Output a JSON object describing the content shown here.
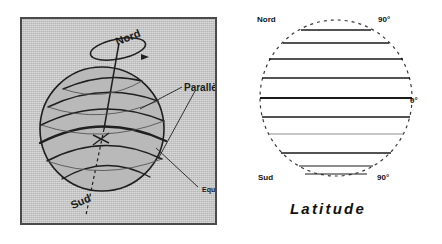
{
  "figures": {
    "globe": {
      "name": "globe-diagram",
      "labels": {
        "nord": "Nord",
        "sud": "Sud",
        "paralleles": "Parallèles",
        "equateur": "Equateur"
      },
      "colors": {
        "panel_background": "#c9c9c9",
        "panel_border": "#4a4a4a",
        "line": "#1a1a1a",
        "sphere_fill": "#b4b4b4"
      }
    },
    "latitude": {
      "name": "latitude-diagram",
      "caption": "Latitude",
      "labels": {
        "nord": "Nord",
        "north_pole_degrees": "90°",
        "equator_degrees": "0°",
        "sud": "Sud",
        "south_pole_degrees": "90°"
      },
      "colors": {
        "outline": "#333333",
        "parallel_line": "#1a1a1a",
        "background": "#ffffff"
      }
    }
  },
  "page": {
    "background": "#ffffff"
  }
}
